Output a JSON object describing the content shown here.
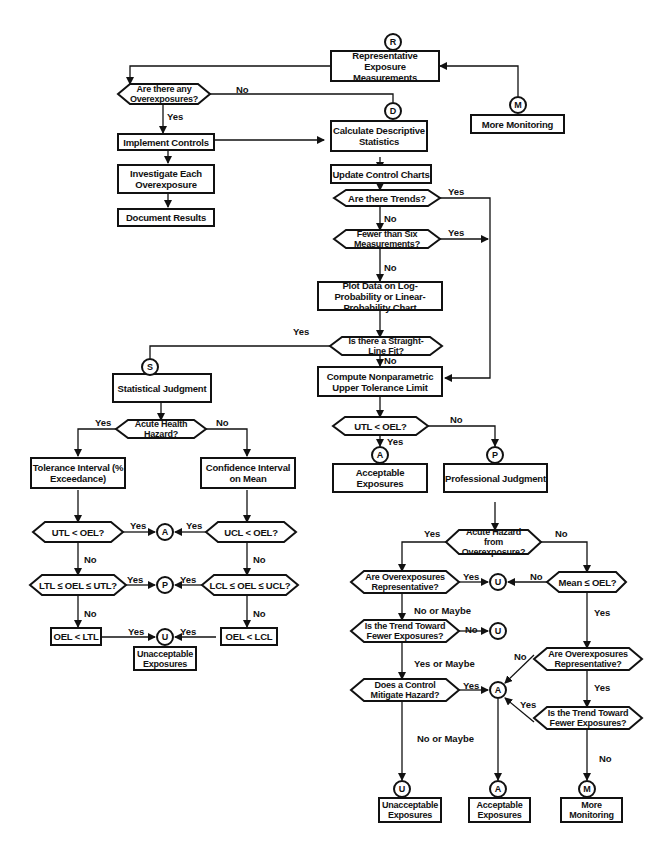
{
  "diagram": {
    "connectors": {
      "R": "R",
      "D": "D",
      "M": "M",
      "S": "S",
      "A": "A",
      "P": "P",
      "U": "U"
    },
    "nodes": {
      "rep_exposure": "Representative Exposure Measurements",
      "any_overexposures": "Are there any Overexposures?",
      "more_monitoring_top": "More Monitoring",
      "implement_controls": "Implement Controls",
      "calc_stats": "Calculate Descriptive Statistics",
      "investigate": "Investigate Each Overexposure",
      "update_charts": "Update Control Charts",
      "document_results": "Document Results",
      "trends": "Are there Trends?",
      "fewer_six": "Fewer than Six Measurements?",
      "plot_data": "Plot Data on Log-Probability or Linear-Probability Chart",
      "straight_line": "Is there a Straight-Line Fit?",
      "statistical_judgment": "Statistical Judgment",
      "compute_nonparam": "Compute Nonparametric Upper Tolerance Limit",
      "acute_health": "Acute Health Hazard?",
      "utl_oel_main": "UTL < OEL?",
      "tolerance_interval": "Tolerance Interval (% Exceedance)",
      "confidence_interval": "Confidence Interval on Mean",
      "acceptable_main": "Acceptable Exposures",
      "professional_judgment": "Professional Judgment",
      "utl_oel_left": "UTL < OEL?",
      "ucl_oel": "UCL < OEL?",
      "ltl_range": "LTL ≤ OEL ≤ UTL?",
      "lcl_range": "LCL ≤ OEL ≤ UCL?",
      "oel_ltl": "OEL < LTL",
      "oel_lcl": "OEL < LCL",
      "unacceptable_left": "Unacceptable Exposures",
      "acute_overexposure": "Acute Hazard from Overexposure?",
      "overexp_rep_left": "Are Overexposures Representative?",
      "mean_oel": "Mean ≤ OEL?",
      "trend_fewer_left": "Is the Trend Toward Fewer Exposures?",
      "overexp_rep_right": "Are Overexposures Representative?",
      "control_mitigate": "Does a Control Mitigate Hazard?",
      "trend_fewer_right": "Is the Trend Toward Fewer Exposures?",
      "unacceptable_bottom": "Unacceptable Exposures",
      "acceptable_bottom": "Acceptable Exposures",
      "more_monitoring_bottom": "More Monitoring"
    },
    "edge_labels": {
      "yes": "Yes",
      "no": "No",
      "no_or_maybe": "No or Maybe",
      "yes_or_maybe": "Yes or Maybe"
    }
  }
}
